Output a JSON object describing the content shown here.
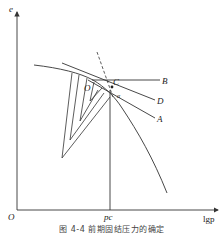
{
  "figure": {
    "caption": "图 4-4  前期固结压力的确定",
    "axes": {
      "y_label": "e",
      "x_label": "lgp",
      "origin_label": "O",
      "x_marker_label": "pc"
    },
    "points": {
      "O_label": "O",
      "C_label": "C",
      "alpha_label": "α"
    },
    "lines": {
      "B_label": "B",
      "D_label": "D",
      "A_label": "A"
    },
    "colors": {
      "line": "#333333",
      "background": "#ffffff"
    }
  }
}
